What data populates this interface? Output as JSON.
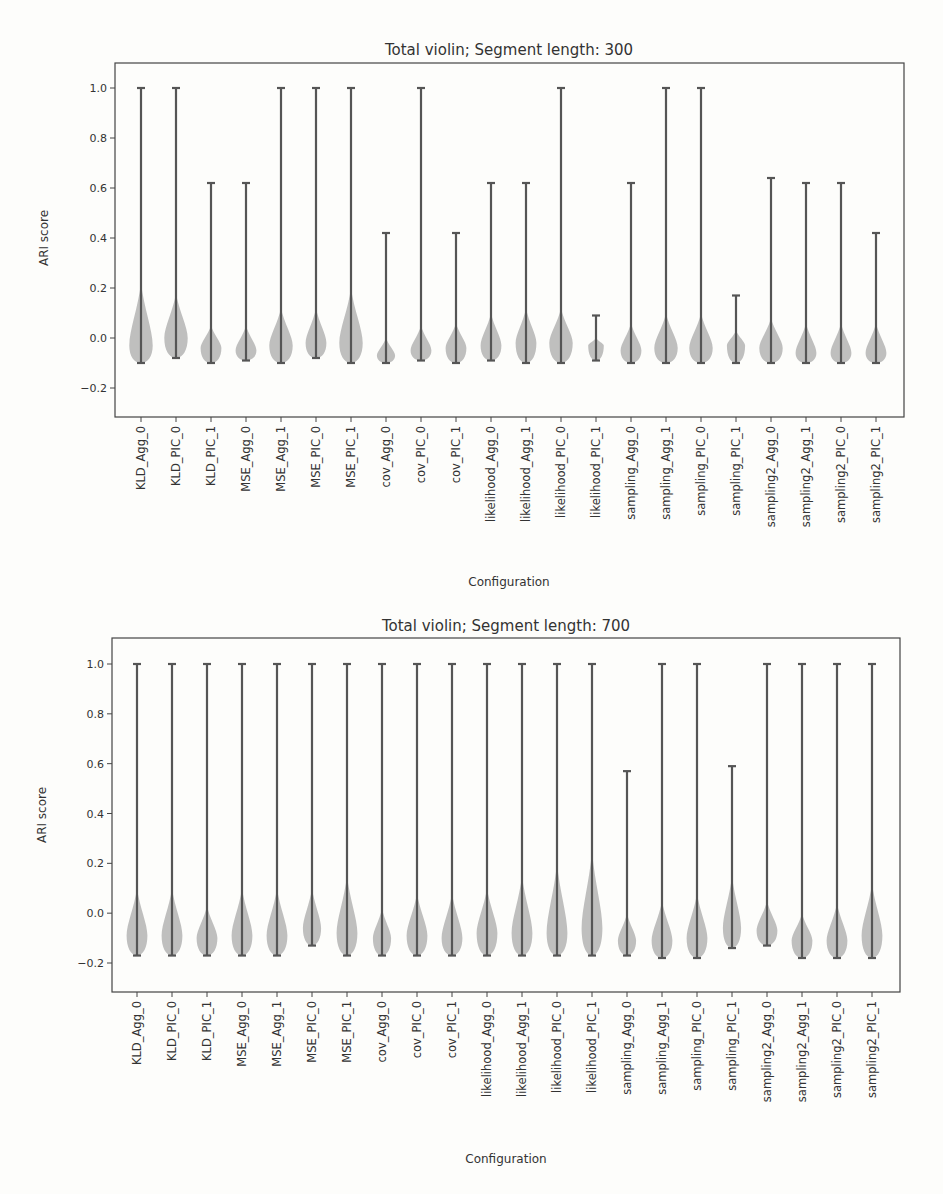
{
  "chart_data": [
    {
      "type": "violin",
      "title": "Total violin; Segment length: 300",
      "xlabel": "Configuration",
      "ylabel": "ARI score",
      "ylim": [
        -0.3,
        1.1
      ],
      "yticks": [
        -0.2,
        0.0,
        0.2,
        0.4,
        0.6,
        0.8,
        1.0
      ],
      "ytick_labels": [
        "−0.2",
        "0.0",
        "0.2",
        "0.4",
        "0.6",
        "0.8",
        "1.0"
      ],
      "grid": false,
      "categories": [
        "KLD_Agg_0",
        "KLD_PIC_0",
        "KLD_PIC_1",
        "MSE_Agg_0",
        "MSE_Agg_1",
        "MSE_PIC_0",
        "MSE_PIC_1",
        "cov_Agg_0",
        "cov_PIC_0",
        "cov_PIC_1",
        "likelihood_Agg_0",
        "likelihood_Agg_1",
        "likelihood_PIC_0",
        "likelihood_PIC_1",
        "sampling_Agg_0",
        "sampling_Agg_1",
        "sampling_PIC_0",
        "sampling_PIC_1",
        "sampling2_Agg_0",
        "sampling2_Agg_1",
        "sampling2_PIC_0",
        "sampling2_PIC_1"
      ],
      "max": [
        1.0,
        1.0,
        0.62,
        0.62,
        1.0,
        1.0,
        1.0,
        0.42,
        1.0,
        0.42,
        0.62,
        0.62,
        1.0,
        0.09,
        0.62,
        1.0,
        1.0,
        0.17,
        0.64,
        0.62,
        0.62,
        0.42
      ],
      "min": [
        -0.1,
        -0.08,
        -0.1,
        -0.09,
        -0.1,
        -0.08,
        -0.1,
        -0.1,
        -0.09,
        -0.1,
        -0.09,
        -0.1,
        -0.1,
        -0.09,
        -0.1,
        -0.1,
        -0.1,
        -0.1,
        -0.1,
        -0.1,
        -0.1,
        -0.1
      ],
      "body_top": [
        0.22,
        0.18,
        0.05,
        0.05,
        0.12,
        0.12,
        0.2,
        0.0,
        0.05,
        0.06,
        0.1,
        0.12,
        0.12,
        0.0,
        0.06,
        0.1,
        0.1,
        0.03,
        0.08,
        0.06,
        0.06,
        0.06
      ],
      "body_width": [
        0.9,
        0.9,
        0.8,
        0.8,
        0.9,
        0.8,
        0.9,
        0.7,
        0.8,
        0.8,
        0.8,
        0.8,
        0.9,
        0.6,
        0.8,
        0.9,
        0.9,
        0.7,
        0.9,
        0.8,
        0.8,
        0.8
      ],
      "body_center": [
        -0.03,
        0.0,
        -0.04,
        -0.05,
        -0.03,
        -0.02,
        -0.02,
        -0.07,
        -0.05,
        -0.04,
        -0.03,
        -0.02,
        -0.02,
        -0.03,
        -0.05,
        -0.04,
        -0.04,
        -0.03,
        -0.04,
        -0.06,
        -0.06,
        -0.06
      ]
    },
    {
      "type": "violin",
      "title": "Total violin; Segment length: 700",
      "xlabel": "Configuration",
      "ylabel": "ARI score",
      "ylim": [
        -0.3,
        1.1
      ],
      "yticks": [
        -0.2,
        0.0,
        0.2,
        0.4,
        0.6,
        0.8,
        1.0
      ],
      "ytick_labels": [
        "−0.2",
        "0.0",
        "0.2",
        "0.4",
        "0.6",
        "0.8",
        "1.0"
      ],
      "grid": false,
      "categories": [
        "KLD_Agg_0",
        "KLD_PIC_0",
        "KLD_PIC_1",
        "MSE_Agg_0",
        "MSE_Agg_1",
        "MSE_PIC_0",
        "MSE_PIC_1",
        "cov_Agg_0",
        "cov_PIC_0",
        "cov_PIC_1",
        "likelihood_Agg_0",
        "likelihood_Agg_1",
        "likelihood_PIC_0",
        "likelihood_PIC_1",
        "sampling_Agg_0",
        "sampling_Agg_1",
        "sampling_PIC_0",
        "sampling_PIC_1",
        "sampling2_Agg_0",
        "sampling2_Agg_1",
        "sampling2_PIC_0",
        "sampling2_PIC_1"
      ],
      "max": [
        1.0,
        1.0,
        1.0,
        1.0,
        1.0,
        1.0,
        1.0,
        1.0,
        1.0,
        1.0,
        1.0,
        1.0,
        1.0,
        1.0,
        0.57,
        1.0,
        1.0,
        0.59,
        1.0,
        1.0,
        1.0,
        1.0
      ],
      "min": [
        -0.17,
        -0.17,
        -0.17,
        -0.17,
        -0.17,
        -0.13,
        -0.17,
        -0.17,
        -0.17,
        -0.17,
        -0.17,
        -0.17,
        -0.17,
        -0.17,
        -0.17,
        -0.18,
        -0.18,
        -0.14,
        -0.13,
        -0.18,
        -0.18,
        -0.18
      ],
      "body_top": [
        0.1,
        0.1,
        0.03,
        0.1,
        0.1,
        0.1,
        0.15,
        0.02,
        0.08,
        0.08,
        0.1,
        0.15,
        0.2,
        0.25,
        0.0,
        0.05,
        0.08,
        0.15,
        0.05,
        0.0,
        0.04,
        0.12
      ],
      "body_width": [
        0.8,
        0.8,
        0.8,
        0.8,
        0.8,
        0.7,
        0.8,
        0.7,
        0.8,
        0.8,
        0.8,
        0.8,
        0.8,
        0.8,
        0.7,
        0.8,
        0.8,
        0.7,
        0.8,
        0.8,
        0.8,
        0.8
      ],
      "body_center": [
        -0.09,
        -0.09,
        -0.1,
        -0.09,
        -0.09,
        -0.06,
        -0.08,
        -0.1,
        -0.09,
        -0.1,
        -0.08,
        -0.08,
        -0.08,
        -0.06,
        -0.11,
        -0.11,
        -0.1,
        -0.06,
        -0.07,
        -0.11,
        -0.11,
        -0.09
      ]
    }
  ]
}
